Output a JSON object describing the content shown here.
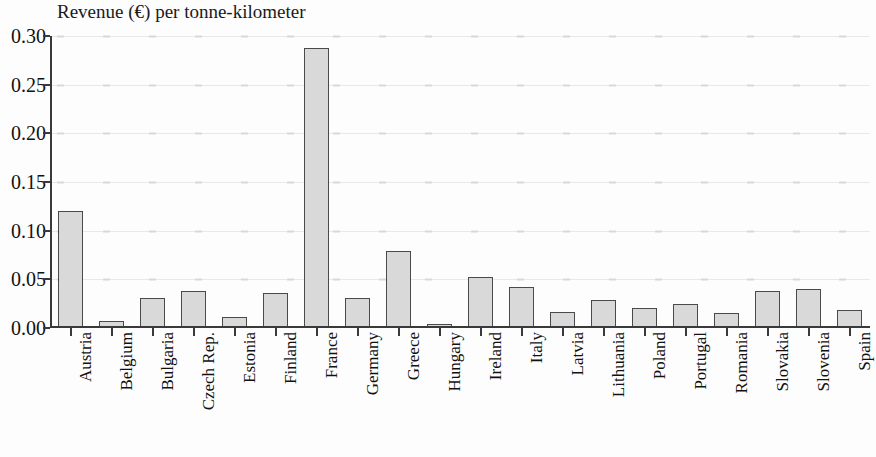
{
  "chart_data": {
    "type": "bar",
    "title": "Revenue (€) per tonne-kilometer",
    "xlabel": "",
    "ylabel": "",
    "ylim": [
      0.0,
      0.3
    ],
    "ytick_labels": [
      "0.30",
      "0.25",
      "0.20",
      "0.15",
      "0.10",
      "0.05",
      "0.00"
    ],
    "ytick_values": [
      0.3,
      0.25,
      0.2,
      0.15,
      0.1,
      0.05,
      0.0
    ],
    "grid": true,
    "legend": null,
    "categories": [
      "Austria",
      "Belgium",
      "Bulgaria",
      "Czech Rep.",
      "Estonia",
      "Finland",
      "France",
      "Germany",
      "Greece",
      "Hungary",
      "Ireland",
      "Italy",
      "Latvia",
      "Lithuania",
      "Poland",
      "Portugal",
      "Romania",
      "Slovakia",
      "Slovenia",
      "Spain"
    ],
    "values": [
      0.12,
      0.007,
      0.031,
      0.038,
      0.011,
      0.036,
      0.288,
      0.031,
      0.079,
      0.004,
      0.052,
      0.042,
      0.016,
      0.029,
      0.021,
      0.025,
      0.015,
      0.038,
      0.04,
      0.018
    ],
    "bar_color": "#d9d9d9",
    "bar_edge_color": "#4a4a4a"
  }
}
